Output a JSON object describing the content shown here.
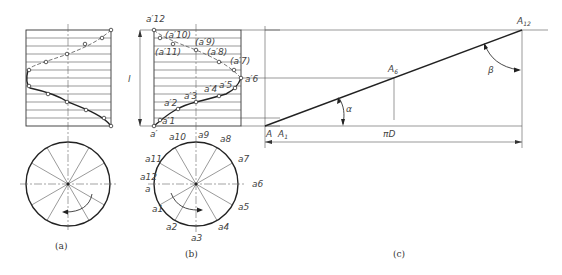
{
  "figure": {
    "panel_a": {
      "caption": "(a)"
    },
    "panel_b": {
      "caption": "(b)",
      "lead_label": "l",
      "front_view_labels": {
        "a12_prime": "a′12",
        "a10_prime": "(a′10)",
        "a9_prime": "(a′9)",
        "a11_prime": "(a′11)",
        "a8_prime": "(a′8)",
        "a7_prime": "(a′7)",
        "a6_prime": "a′6",
        "a4_prime": "a′4",
        "a5_prime": "a′5",
        "a3_prime": "a′3",
        "a2_prime": "a′2",
        "a1_prime": "a′1",
        "a_prime": "a′"
      },
      "circle_labels": {
        "a10": "a10",
        "a9": "a9",
        "a8": "a8",
        "a11": "a11",
        "a7": "a7",
        "a12": "a12",
        "a": "a",
        "a6": "a6",
        "a1": "a1",
        "a5": "a5",
        "a2": "a2",
        "a4": "a4",
        "a3": "a3"
      }
    },
    "panel_c": {
      "caption": "(c)",
      "labels": {
        "A": "A",
        "A1": "A1",
        "A6": "A6",
        "A12": "A12",
        "alpha": "α",
        "beta": "β",
        "piD": "πD"
      }
    }
  }
}
